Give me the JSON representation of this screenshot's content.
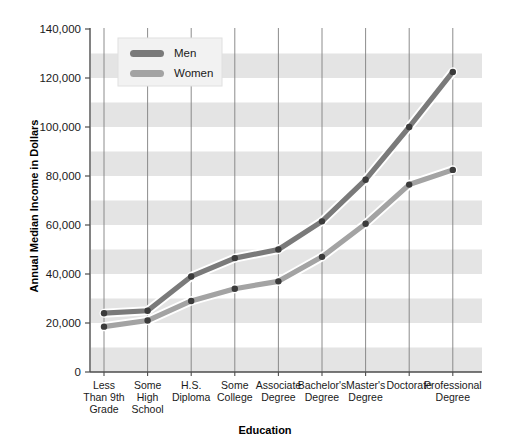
{
  "chart_data": {
    "type": "line",
    "title": "",
    "xlabel": "Education",
    "ylabel": "Annual Median Income in Dollars",
    "categories": [
      "Less Than 9th Grade",
      "Some High School",
      "H.S. Diploma",
      "Some College",
      "Associate Degree",
      "Bachelor's Degree",
      "Master's Degree",
      "Doctorate",
      "Professional Degree"
    ],
    "category_lines": [
      [
        "Less",
        "Than 9th",
        "Grade"
      ],
      [
        "Some",
        "High",
        "School"
      ],
      [
        "H.S.",
        "Diploma"
      ],
      [
        "Some",
        "College"
      ],
      [
        "Associate",
        "Degree"
      ],
      [
        "Bachelor's",
        "Degree"
      ],
      [
        "Master's",
        "Degree"
      ],
      [
        "Doctorate"
      ],
      [
        "Professional",
        "Degree"
      ]
    ],
    "series": [
      {
        "name": "Men",
        "color": "#7a7a7a",
        "values": [
          24000,
          25000,
          39000,
          46500,
          50000,
          61500,
          78500,
          100000,
          122500
        ]
      },
      {
        "name": "Women",
        "color": "#a3a3a3",
        "values": [
          18500,
          21000,
          29000,
          34000,
          37000,
          47000,
          60500,
          76500,
          82500
        ]
      }
    ],
    "ylim": [
      0,
      140000
    ],
    "yticks": [
      0,
      20000,
      40000,
      60000,
      80000,
      100000,
      120000,
      140000
    ],
    "ytick_labels": [
      "0",
      "20,000",
      "40,000",
      "60,000",
      "80,000",
      "100,000",
      "120,000",
      "140,000"
    ],
    "grid": {
      "vertical": true,
      "horizontal_bands": true,
      "band_interval": 10000,
      "band_color": "#e4e4e4",
      "gridline_color": "#7f7f7f"
    },
    "legend": {
      "position": "top-left-inside",
      "entries": [
        "Men",
        "Women"
      ]
    },
    "marker_color": "#3b3b3b"
  }
}
